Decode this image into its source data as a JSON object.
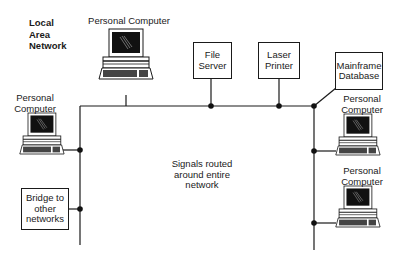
{
  "diagram": {
    "title_lines": [
      "Local",
      "Area",
      "Network"
    ],
    "center_note_lines": [
      "Signals routed",
      "around entire",
      "network"
    ],
    "nodes": {
      "pc_top": {
        "label": "Personal Computer"
      },
      "pc_left": {
        "label_lines": [
          "Personal",
          "Computer"
        ]
      },
      "file_server": {
        "label_lines": [
          "File",
          "Server"
        ]
      },
      "laser_printer": {
        "label_lines": [
          "Laser",
          "Printer"
        ]
      },
      "mainframe": {
        "label_lines": [
          "Mainframe",
          "Database"
        ]
      },
      "pc_right_1": {
        "label_lines": [
          "Personal",
          "Computer"
        ]
      },
      "pc_right_2": {
        "label_lines": [
          "Personal",
          "Computer"
        ]
      },
      "bridge": {
        "label_lines": [
          "Bridge to",
          "other",
          "networks"
        ]
      }
    },
    "colors": {
      "line": "#1a1a1a",
      "screen": "#111111",
      "background": "#ffffff"
    }
  }
}
